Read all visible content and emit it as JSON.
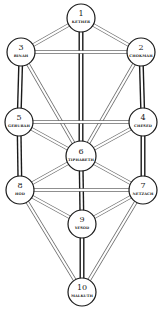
{
  "diagram": {
    "colors": {
      "line": "#1a1a1a",
      "thin_line": "#6a6a6a",
      "background": "#ffffff"
    },
    "sephiroth": [
      {
        "id": "kether",
        "number": "1",
        "name": "KETHER",
        "x": 81,
        "y": 18,
        "r": 14
      },
      {
        "id": "chokmah",
        "number": "2",
        "name": "CHOKMAH",
        "x": 141,
        "y": 52,
        "r": 14
      },
      {
        "id": "binah",
        "number": "3",
        "name": "BINAH",
        "x": 21,
        "y": 52,
        "r": 14
      },
      {
        "id": "chesed",
        "number": "4",
        "name": "CHESED",
        "x": 143,
        "y": 122,
        "r": 14
      },
      {
        "id": "geburah",
        "number": "5",
        "name": "GEBURAH",
        "x": 19,
        "y": 122,
        "r": 14
      },
      {
        "id": "tiphareth",
        "number": "6",
        "name": "TIPHARETH",
        "x": 81,
        "y": 156,
        "r": 15
      },
      {
        "id": "netzach",
        "number": "7",
        "name": "NETZACH",
        "x": 143,
        "y": 190,
        "r": 14
      },
      {
        "id": "hod",
        "number": "8",
        "name": "HOD",
        "x": 20,
        "y": 190,
        "r": 14
      },
      {
        "id": "yesod",
        "number": "9",
        "name": "YESOD",
        "x": 82,
        "y": 224,
        "r": 14
      },
      {
        "id": "malkuth",
        "number": "10",
        "name": "MALKUTH",
        "x": 82,
        "y": 292,
        "r": 14
      }
    ],
    "paths": [
      {
        "from": "kether",
        "to": "chokmah",
        "weight": "thin"
      },
      {
        "from": "kether",
        "to": "binah",
        "weight": "thin"
      },
      {
        "from": "kether",
        "to": "tiphareth",
        "weight": "thick"
      },
      {
        "from": "chokmah",
        "to": "binah",
        "weight": "thin"
      },
      {
        "from": "chokmah",
        "to": "tiphareth",
        "weight": "thin"
      },
      {
        "from": "chokmah",
        "to": "chesed",
        "weight": "thick"
      },
      {
        "from": "binah",
        "to": "tiphareth",
        "weight": "thin"
      },
      {
        "from": "binah",
        "to": "geburah",
        "weight": "thick"
      },
      {
        "from": "chesed",
        "to": "geburah",
        "weight": "thin"
      },
      {
        "from": "chesed",
        "to": "tiphareth",
        "weight": "thin"
      },
      {
        "from": "chesed",
        "to": "netzach",
        "weight": "thick"
      },
      {
        "from": "geburah",
        "to": "tiphareth",
        "weight": "thin"
      },
      {
        "from": "geburah",
        "to": "hod",
        "weight": "thick"
      },
      {
        "from": "tiphareth",
        "to": "netzach",
        "weight": "thin"
      },
      {
        "from": "tiphareth",
        "to": "hod",
        "weight": "thin"
      },
      {
        "from": "tiphareth",
        "to": "yesod",
        "weight": "thick"
      },
      {
        "from": "netzach",
        "to": "hod",
        "weight": "thin"
      },
      {
        "from": "netzach",
        "to": "yesod",
        "weight": "thin"
      },
      {
        "from": "netzach",
        "to": "malkuth",
        "weight": "thin"
      },
      {
        "from": "hod",
        "to": "yesod",
        "weight": "thin"
      },
      {
        "from": "hod",
        "to": "malkuth",
        "weight": "thin"
      },
      {
        "from": "yesod",
        "to": "malkuth",
        "weight": "thick"
      }
    ]
  }
}
